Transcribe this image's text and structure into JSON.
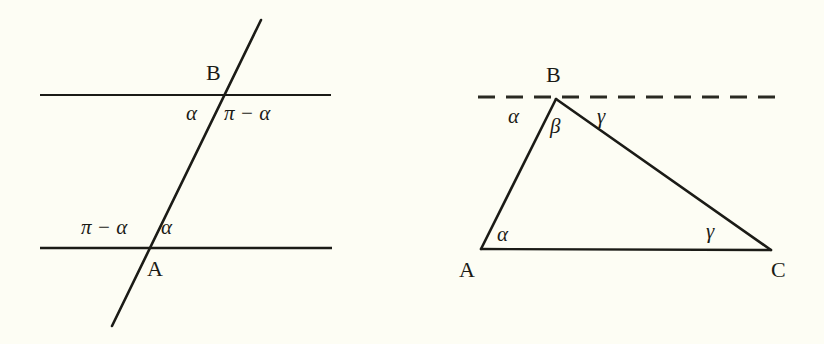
{
  "figure": {
    "background_color": "#fdfdf4",
    "stroke_color": "#1b1b16",
    "panels": [
      {
        "id": "left",
        "name": "parallel-lines-transversal",
        "lines": [
          {
            "name": "upper-parallel-line",
            "style": "solid",
            "x1": 40,
            "y1": 95,
            "x2": 331,
            "y2": 95
          },
          {
            "name": "lower-parallel-line",
            "style": "solid",
            "x1": 40,
            "y1": 248,
            "x2": 332,
            "y2": 248
          },
          {
            "name": "transversal-line",
            "style": "solid",
            "x1": 261,
            "y1": 20,
            "x2": 112,
            "y2": 326
          }
        ],
        "labels": [
          {
            "name": "point-label-B",
            "kind": "point",
            "text": "B",
            "x": 206,
            "y": 62
          },
          {
            "name": "point-label-A",
            "kind": "point",
            "text": "A",
            "x": 147,
            "y": 258
          },
          {
            "name": "angle-label-B-left",
            "kind": "angle",
            "text": "α",
            "x": 186,
            "y": 103
          },
          {
            "name": "angle-label-B-right",
            "kind": "expr",
            "text": "π − α",
            "x": 224,
            "y": 103
          },
          {
            "name": "angle-label-A-left",
            "kind": "expr",
            "text": "π − α",
            "x": 81,
            "y": 217
          },
          {
            "name": "angle-label-A-right",
            "kind": "angle",
            "text": "α",
            "x": 161,
            "y": 217
          }
        ]
      },
      {
        "id": "right",
        "name": "triangle-angle-sum",
        "lines": [
          {
            "name": "dashed-line-through-B",
            "style": "dashed",
            "x1": 478,
            "y1": 97,
            "x2": 779,
            "y2": 97
          },
          {
            "name": "triangle-side-AB",
            "style": "solid",
            "x1": 481,
            "y1": 249,
            "x2": 556,
            "y2": 99
          },
          {
            "name": "triangle-side-BC",
            "style": "solid",
            "x1": 556,
            "y1": 99,
            "x2": 771,
            "y2": 250
          },
          {
            "name": "triangle-side-AC",
            "style": "solid",
            "x1": 481,
            "y1": 249,
            "x2": 771,
            "y2": 250
          }
        ],
        "labels": [
          {
            "name": "vertex-label-B",
            "kind": "point",
            "text": "B",
            "x": 546,
            "y": 64
          },
          {
            "name": "vertex-label-A",
            "kind": "point",
            "text": "A",
            "x": 459,
            "y": 259
          },
          {
            "name": "vertex-label-C",
            "kind": "point",
            "text": "C",
            "x": 771,
            "y": 259
          },
          {
            "name": "angle-label-alpha-at-B",
            "kind": "angle",
            "text": "α",
            "x": 508,
            "y": 106
          },
          {
            "name": "angle-label-beta-at-B",
            "kind": "angle",
            "text": "β",
            "x": 550,
            "y": 116
          },
          {
            "name": "angle-label-gamma-at-B",
            "kind": "angle",
            "text": "γ",
            "x": 597,
            "y": 106
          },
          {
            "name": "angle-label-alpha-at-A",
            "kind": "angle",
            "text": "α",
            "x": 497,
            "y": 224
          },
          {
            "name": "angle-label-gamma-at-C",
            "kind": "angle",
            "text": "γ",
            "x": 706,
            "y": 221
          }
        ]
      }
    ]
  }
}
